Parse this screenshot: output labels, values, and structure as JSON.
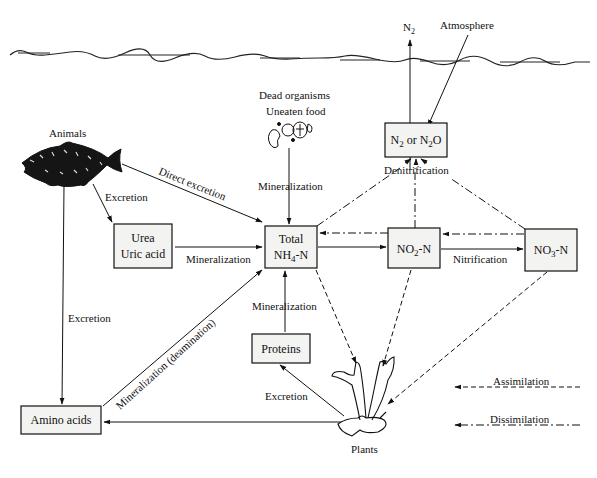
{
  "diagram": {
    "type": "nitrogen-cycle-flow",
    "surface": {
      "n2_label": "N",
      "n2_sub": "2",
      "atmosphere_label": "Atmosphere"
    },
    "sources": {
      "dead_organisms": "Dead organisms",
      "uneaten_food": "Uneaten food",
      "animals": "Animals",
      "plants": "Plants"
    },
    "nodes": {
      "urea": {
        "line1": "Urea",
        "line2": "Uric acid"
      },
      "total_nh4": {
        "line1": "Total",
        "line2_pre": "NH",
        "line2_sub": "4",
        "line2_post": "-N"
      },
      "no2": {
        "pre": "NO",
        "sub": "2",
        "post": "-N"
      },
      "no3": {
        "pre": "NO",
        "sub": "3",
        "post": "-N"
      },
      "n2_n2o": {
        "a": "N",
        "a_sub": "2",
        "mid": " or N",
        "b_sub": "2",
        "b_post": "O"
      },
      "proteins": "Proteins",
      "amino_acids": "Amino acids"
    },
    "edges": {
      "direct_excretion": "Direct excretion",
      "excretion_urea": "Excretion",
      "mineralization_urea": "Mineralization",
      "mineralization_dead": "Mineralization",
      "denitrification": "Denitrification",
      "nitrification": "Nitrification",
      "mineralization_proteins": "Mineralization",
      "excretion_plants": "Excretion",
      "excretion_animals": "Excretion",
      "mineralization_deamination": "Mineralization (deamination)"
    },
    "legend": {
      "assimilation": "Assimilation",
      "dissimilation": "Dissimilation"
    }
  }
}
